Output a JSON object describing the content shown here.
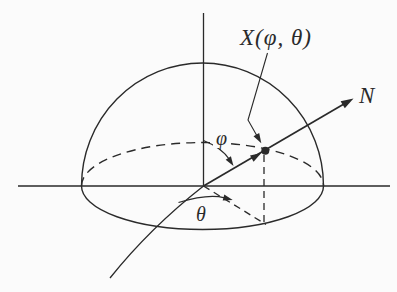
{
  "figure": {
    "type": "hemisphere-spherical-coordinates-diagram",
    "labels": {
      "point": "X(φ, θ)",
      "normal": "N",
      "polar_angle": "φ",
      "azimuth_angle": "θ"
    },
    "colors": {
      "ink": "#2a2a2a",
      "background": "#fbfbfb"
    }
  }
}
